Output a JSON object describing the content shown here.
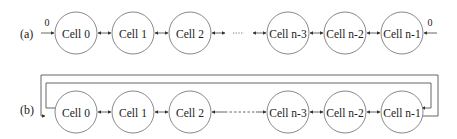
{
  "diagram": {
    "row_a": {
      "label": "(a)",
      "boundary_left_value": "0",
      "boundary_right_value": "0",
      "cells": [
        "Cell 0",
        "Cell 1",
        "Cell 2",
        "Cell n-3",
        "Cell n-2",
        "Cell n-1"
      ],
      "gap_marker": "......"
    },
    "row_b": {
      "label": "(b)",
      "cells": [
        "Cell 0",
        "Cell 1",
        "Cell 2",
        "Cell n-3",
        "Cell n-2",
        "Cell n-1"
      ],
      "gap_marker": "dashed"
    },
    "colors": {
      "stroke": "#555555",
      "circle": "#7a7a7a",
      "text": "#222222",
      "background": "#ffffff"
    }
  }
}
